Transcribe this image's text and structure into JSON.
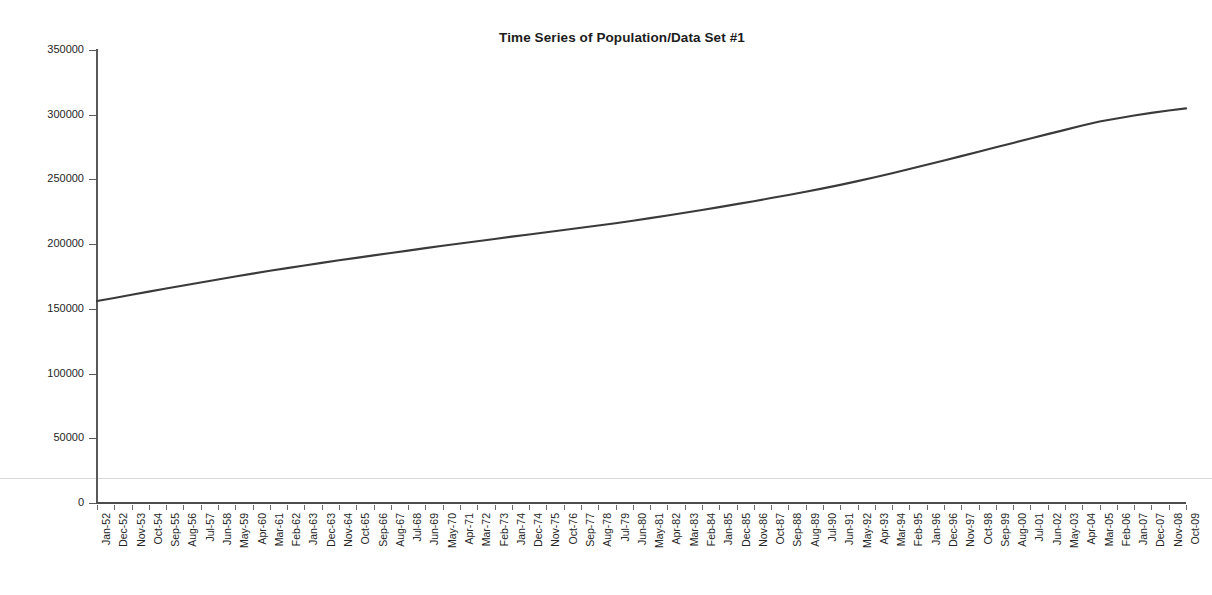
{
  "chart_data": {
    "type": "line",
    "title": "Time Series of Population/Data Set #1",
    "xlabel": "",
    "ylabel": "",
    "ylim": [
      0,
      350000
    ],
    "ytick_values": [
      0,
      50000,
      100000,
      150000,
      200000,
      250000,
      300000,
      350000
    ],
    "ytick_labels": [
      "0",
      "50000",
      "100000",
      "150000",
      "200000",
      "250000",
      "300000",
      "350000"
    ],
    "grid": false,
    "legend": "none",
    "line_color": "#3a3a3a",
    "categories": [
      "Jan-52",
      "Dec-52",
      "Nov-53",
      "Oct-54",
      "Sep-55",
      "Aug-56",
      "Jul-57",
      "Jun-58",
      "May-59",
      "Apr-60",
      "Mar-61",
      "Feb-62",
      "Jan-63",
      "Dec-63",
      "Nov-64",
      "Oct-65",
      "Sep-66",
      "Aug-67",
      "Jul-68",
      "Jun-69",
      "May-70",
      "Apr-71",
      "Mar-72",
      "Feb-73",
      "Jan-74",
      "Dec-74",
      "Nov-75",
      "Oct-76",
      "Sep-77",
      "Aug-78",
      "Jul-79",
      "Jun-80",
      "May-81",
      "Apr-82",
      "Mar-83",
      "Feb-84",
      "Jan-85",
      "Dec-85",
      "Nov-86",
      "Oct-87",
      "Sep-88",
      "Aug-89",
      "Jul-90",
      "Jun-91",
      "May-92",
      "Apr-93",
      "Mar-94",
      "Feb-95",
      "Jan-96",
      "Dec-96",
      "Nov-97",
      "Oct-98",
      "Sep-99",
      "Aug-00",
      "Jul-01",
      "Jun-02",
      "May-03",
      "Apr-04",
      "Mar-05",
      "Feb-06",
      "Jan-07",
      "Dec-07",
      "Nov-08",
      "Oct-09"
    ],
    "series": [
      {
        "name": "Population",
        "values": [
          156000,
          158400,
          160900,
          163300,
          165700,
          168100,
          170400,
          172700,
          175000,
          177200,
          179400,
          181500,
          183500,
          185500,
          187500,
          189400,
          191300,
          193200,
          195000,
          196900,
          198700,
          200500,
          202300,
          204000,
          205800,
          207500,
          209200,
          210900,
          212600,
          214400,
          216200,
          218100,
          220100,
          222100,
          224200,
          226400,
          228600,
          230900,
          233200,
          235600,
          238000,
          240500,
          243100,
          245800,
          248700,
          251700,
          254800,
          258000,
          261300,
          264600,
          268000,
          271400,
          274800,
          278200,
          281600,
          285000,
          288300,
          291600,
          294800,
          297100,
          299400,
          301400,
          303300,
          304900
        ]
      }
    ]
  }
}
